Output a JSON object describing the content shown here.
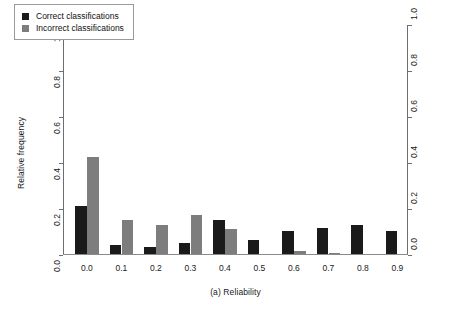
{
  "chart_data": {
    "type": "bar",
    "title": "",
    "subtitle": "",
    "xlabel": "(a) Reliability",
    "ylabel": "Relative frequency",
    "categories": [
      "0.0",
      "0.1",
      "0.2",
      "0.3",
      "0.4",
      "0.5",
      "0.6",
      "0.7",
      "0.8",
      "0.9"
    ],
    "series": [
      {
        "name": "Correct classifications",
        "color": "#1a1a1a",
        "values": [
          0.21,
          0.04,
          0.03,
          0.05,
          0.15,
          0.06,
          0.1,
          0.115,
          0.125,
          0.1
        ]
      },
      {
        "name": "Incorrect classifications",
        "color": "#7d7d7d",
        "values": [
          0.42,
          0.15,
          0.125,
          0.17,
          0.11,
          0.0,
          0.015,
          0.005,
          0.0,
          0.0
        ]
      }
    ],
    "ylim": [
      0.0,
      1.0
    ],
    "yticks": [
      "0.0",
      "0.2",
      "0.4",
      "0.6",
      "0.8",
      "1.0"
    ],
    "ytick_values": [
      0.0,
      0.2,
      0.4,
      0.6,
      0.8,
      1.0
    ],
    "grid": false,
    "legend_position": "top-left",
    "right_axis_mirrored": true
  },
  "legend": {
    "items": [
      {
        "label": "Correct classifications",
        "color": "#1a1a1a"
      },
      {
        "label": "Incorrect classifications",
        "color": "#7d7d7d"
      }
    ]
  }
}
